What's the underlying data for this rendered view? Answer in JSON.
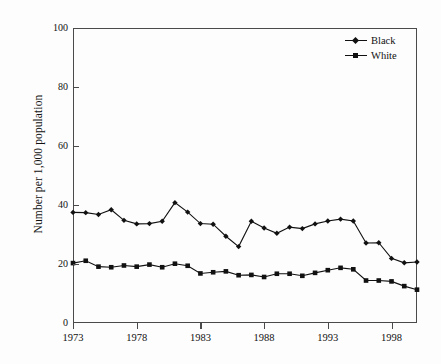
{
  "chart_data": {
    "type": "line",
    "title": "",
    "subtitle": "",
    "xlabel": "",
    "ylabel": "Number per 1,000 population",
    "xlim": [
      1973,
      2000
    ],
    "ylim": [
      0,
      100
    ],
    "grid": false,
    "legend_position": "top-right",
    "x": [
      1973,
      1974,
      1975,
      1976,
      1977,
      1978,
      1979,
      1980,
      1981,
      1982,
      1983,
      1984,
      1985,
      1986,
      1987,
      1988,
      1989,
      1990,
      1991,
      1992,
      1993,
      1994,
      1995,
      1996,
      1997,
      1998,
      1999,
      2000
    ],
    "x_tick_labels": [
      "1973",
      "1978",
      "1983",
      "1988",
      "1993",
      "1998"
    ],
    "x_tick_values": [
      1973,
      1978,
      1983,
      1988,
      1993,
      1998
    ],
    "y_tick_labels": [
      "0",
      "20",
      "40",
      "60",
      "80",
      "100"
    ],
    "y_tick_values": [
      0,
      20,
      40,
      60,
      80,
      100
    ],
    "series": [
      {
        "name": "Black",
        "marker": "diamond",
        "color": "#111111",
        "values": [
          37.5,
          37.4,
          36.8,
          38.4,
          34.8,
          33.6,
          33.7,
          34.5,
          40.8,
          37.6,
          33.7,
          33.5,
          29.4,
          25.9,
          34.5,
          32.2,
          30.4,
          32.5,
          32.0,
          33.6,
          34.6,
          35.2,
          34.6,
          27.1,
          27.2,
          21.9,
          20.4,
          20.7
        ]
      },
      {
        "name": "White",
        "marker": "square",
        "color": "#111111",
        "values": [
          20.3,
          21.1,
          19.1,
          18.9,
          19.5,
          19.1,
          19.8,
          18.9,
          20.1,
          19.4,
          16.8,
          17.2,
          17.5,
          16.2,
          16.3,
          15.6,
          16.7,
          16.7,
          16.0,
          17.0,
          17.9,
          18.7,
          18.2,
          14.4,
          14.4,
          14.1,
          12.5,
          11.3
        ]
      }
    ]
  },
  "legend": {
    "items": [
      {
        "label": "Black",
        "marker": "diamond"
      },
      {
        "label": "White",
        "marker": "square"
      }
    ]
  },
  "axes": {
    "y_title": "Number per 1,000 population"
  }
}
